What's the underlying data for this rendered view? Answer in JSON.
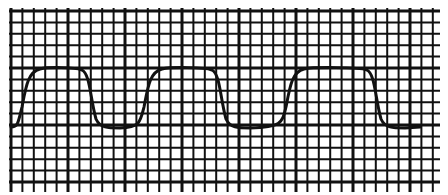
{
  "figure": {
    "background": "#ffffff",
    "grid": {
      "color": "#111111",
      "x_start": 11,
      "x_end": 438,
      "y_start": 11,
      "y_end": 188,
      "spacing": 11.4,
      "major_every": 5,
      "minor_width": 2,
      "major_width": 3
    },
    "waveform": {
      "color": "#111111",
      "stroke_width": 3,
      "high_y": 68,
      "low_y": 127,
      "cycles": [
        {
          "rise_x": 26,
          "fall_x": 92
        },
        {
          "rise_x": 148,
          "fall_x": 222
        },
        {
          "rise_x": 290,
          "fall_x": 377
        }
      ],
      "end_x": 420
    }
  }
}
